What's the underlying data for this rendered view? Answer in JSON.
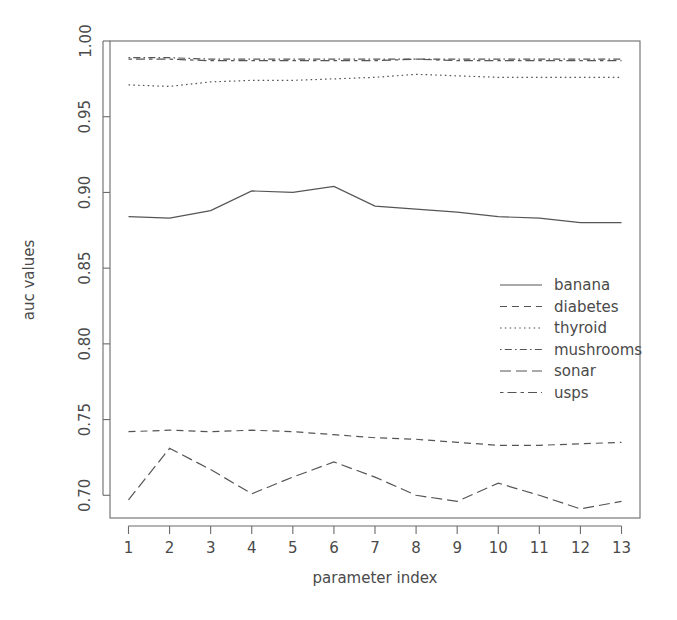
{
  "chart_data": {
    "type": "line",
    "title": "",
    "xlabel": "parameter index",
    "ylabel": "auc values",
    "x": [
      1,
      2,
      3,
      4,
      5,
      6,
      7,
      8,
      9,
      10,
      11,
      12,
      13
    ],
    "xticklabels": [
      "1",
      "2",
      "3",
      "4",
      "5",
      "6",
      "7",
      "8",
      "9",
      "10",
      "11",
      "12",
      "13"
    ],
    "yticklabels": [
      "0.70",
      "0.75",
      "0.80",
      "0.85",
      "0.90",
      "0.95",
      "1.00"
    ],
    "yticks": [
      0.7,
      0.75,
      0.8,
      0.85,
      0.9,
      0.95,
      1.0
    ],
    "xlim": [
      0.55,
      13.45
    ],
    "ylim": [
      0.685,
      1.0
    ],
    "grid": false,
    "legend_position": "center-right",
    "series": [
      {
        "name": "banana",
        "dash": "solid",
        "values": [
          0.884,
          0.883,
          0.888,
          0.901,
          0.9,
          0.904,
          0.891,
          0.889,
          0.887,
          0.884,
          0.883,
          0.88,
          0.88
        ]
      },
      {
        "name": "diabetes",
        "dash": "dashed",
        "values": [
          0.742,
          0.743,
          0.742,
          0.743,
          0.742,
          0.74,
          0.738,
          0.737,
          0.735,
          0.733,
          0.733,
          0.734,
          0.735
        ]
      },
      {
        "name": "thyroid",
        "dash": "dotted",
        "values": [
          0.971,
          0.97,
          0.973,
          0.974,
          0.974,
          0.975,
          0.976,
          0.978,
          0.977,
          0.976,
          0.976,
          0.976,
          0.976
        ]
      },
      {
        "name": "mushrooms",
        "dash": "dotdash",
        "values": [
          0.989,
          0.989,
          0.988,
          0.988,
          0.988,
          0.988,
          0.988,
          0.988,
          0.988,
          0.988,
          0.988,
          0.988,
          0.988
        ]
      },
      {
        "name": "sonar",
        "dash": "longdash",
        "values": [
          0.697,
          0.731,
          0.717,
          0.701,
          0.712,
          0.722,
          0.712,
          0.7,
          0.696,
          0.708,
          0.7,
          0.691,
          0.696
        ]
      },
      {
        "name": "usps",
        "dash": "twodash",
        "values": [
          0.988,
          0.988,
          0.987,
          0.987,
          0.987,
          0.987,
          0.987,
          0.988,
          0.987,
          0.987,
          0.987,
          0.987,
          0.987
        ]
      }
    ]
  },
  "legend": {
    "entries": [
      {
        "label": "banana",
        "dash": "solid"
      },
      {
        "label": "diabetes",
        "dash": "dashed"
      },
      {
        "label": "thyroid",
        "dash": "dotted"
      },
      {
        "label": "mushrooms",
        "dash": "dotdash"
      },
      {
        "label": "sonar",
        "dash": "longdash"
      },
      {
        "label": "usps",
        "dash": "twodash"
      }
    ]
  },
  "style": {
    "line_color": "#555555",
    "axis_color": "#6b6b6b",
    "text_color": "#4a4a4a",
    "background": "#ffffff"
  }
}
